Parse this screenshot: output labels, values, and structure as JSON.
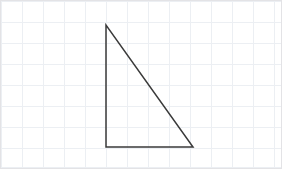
{
  "canvas": {
    "width": 282,
    "height": 169,
    "background_color": "#ffffff",
    "border_color": "#e3e3e6",
    "border_width": 1
  },
  "grid": {
    "visible": true,
    "line_color": "#eceff3",
    "line_width": 1,
    "cell_size": 21,
    "origin_x": 1,
    "origin_y": 1,
    "vertical_lines": [
      1,
      22,
      43,
      64,
      85,
      106,
      127,
      148,
      169,
      190,
      211,
      232,
      253,
      274
    ],
    "horizontal_lines": [
      1,
      22,
      43,
      64,
      85,
      106,
      127,
      148,
      168
    ]
  },
  "chart_data": {
    "type": "diagram",
    "title": "",
    "shape": "right-triangle",
    "stroke_color": "#3a3a3a",
    "stroke_width": 1.5,
    "fill": "none",
    "grid_cell_px": 21,
    "vertices": [
      {
        "name": "apex",
        "x": 106,
        "y": 25
      },
      {
        "name": "right-angle",
        "x": 106,
        "y": 147
      },
      {
        "name": "base-right",
        "x": 193,
        "y": 147
      }
    ],
    "edges": [
      {
        "name": "vertical-leg",
        "from": "apex",
        "to": "right-angle",
        "length_px": 122,
        "length_cells": 5.8
      },
      {
        "name": "horizontal-leg",
        "from": "right-angle",
        "to": "base-right",
        "length_px": 87,
        "length_cells": 4.1
      },
      {
        "name": "hypotenuse",
        "from": "base-right",
        "to": "apex",
        "length_px": 149.8,
        "length_cells": 7.1
      }
    ],
    "points_path": "106,25 106,147 193,147"
  },
  "labels": {
    "none_visible": ""
  }
}
